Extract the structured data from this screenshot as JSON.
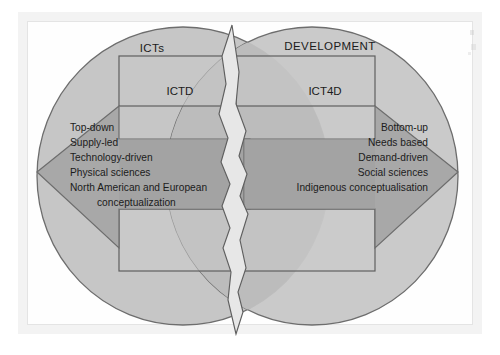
{
  "figure": {
    "title_alt": "Contrasting ICTD and ICT4D conceptualisations",
    "domain_circles": {
      "left_label": "ICTs",
      "right_label": "DEVELOPMENT"
    },
    "boxes": {
      "left_label": "ICTD",
      "right_label": "ICT4D"
    },
    "left_arrow": {
      "direction": "left",
      "items": [
        "Top-down",
        "Supply-led",
        "Technology-driven",
        "Physical sciences",
        "North American and European",
        "conceptualization"
      ]
    },
    "right_arrow": {
      "direction": "right",
      "items": [
        "Bottom-up",
        "Needs based",
        "Demand-driven",
        "Social sciences",
        "Indigenous conceptualisation"
      ]
    },
    "divider": {
      "name": "torn-crack",
      "description": "jagged vertical tear separating the two halves"
    },
    "colors": {
      "page_background": "#ffffff",
      "frame_border": "#e8e8e8",
      "frame_inner": "#fdfdfd",
      "circle_fill": "#c6c6c6",
      "circle_stroke": "#6d6d6d",
      "arrow_fill": "#a8a8a8",
      "arrow_stroke": "#6d6d6d",
      "box_fill": "#c9c9c9",
      "box_stroke": "#5f5f5f",
      "crack_fill": "#e7e7e7",
      "crack_stroke": "#5f5f5f",
      "text": "#1b1b1b"
    }
  }
}
